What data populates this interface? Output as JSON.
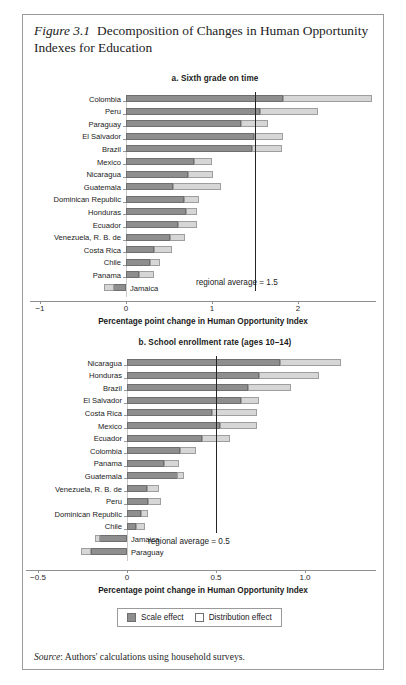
{
  "figure": {
    "number": "Figure 3.1",
    "title": "Decomposition of Changes in Human Opportunity Indexes for Education"
  },
  "source": {
    "label": "Source",
    "text": ": Authors' calculations using household surveys."
  },
  "legend": {
    "scale_label": "Scale effect",
    "distribution_label": "Distribution effect"
  },
  "colors": {
    "scale_effect": "#8e8e8e",
    "distribution_effect": "#d6d6d6",
    "average_line": "#242424",
    "frame": "#9a9a9a"
  },
  "chart_data": [
    {
      "type": "bar",
      "orientation": "horizontal",
      "stacked": true,
      "panel": "a",
      "title": "a. Sixth grade on time",
      "xlabel": "Percentage point change in Human Opportunity Index",
      "ylabel": "",
      "xlim": [
        -1,
        2.9
      ],
      "xticks": [
        -1,
        0,
        1,
        2
      ],
      "xticklabels": [
        "−1",
        "0",
        "1",
        "2"
      ],
      "grid": false,
      "legend_position": "bottom",
      "annotation": "regional average = 1.5",
      "annotation_value": 1.5,
      "categories": [
        "Colombia",
        "Peru",
        "Paraguay",
        "El Salvador",
        "Brazil",
        "Mexico",
        "Nicaragua",
        "Guatemala",
        "Dominican Republic",
        "Honduras",
        "Ecuador",
        "Venezuela, R. B. de",
        "Costa Rica",
        "Chile",
        "Panama",
        "Jamaica"
      ],
      "series": [
        {
          "name": "Scale effect",
          "values": [
            1.83,
            1.56,
            1.34,
            1.49,
            1.47,
            0.79,
            0.72,
            0.55,
            0.68,
            0.7,
            0.61,
            0.51,
            0.33,
            0.28,
            0.15,
            -0.26
          ]
        },
        {
          "name": "Distribution effect",
          "values": [
            1.03,
            0.67,
            0.31,
            0.33,
            0.34,
            0.21,
            0.29,
            0.55,
            0.17,
            0.12,
            0.21,
            0.18,
            0.21,
            0.11,
            0.18,
            0.12
          ]
        }
      ],
      "totals": [
        2.86,
        2.23,
        1.65,
        1.82,
        1.81,
        1.0,
        1.01,
        1.1,
        0.85,
        0.82,
        0.82,
        0.69,
        0.54,
        0.39,
        0.33,
        -0.14
      ]
    },
    {
      "type": "bar",
      "orientation": "horizontal",
      "stacked": true,
      "panel": "b",
      "title": "b. School enrollment rate (ages 10–14)",
      "xlabel": "Percentage point change in Human Opportunity Index",
      "ylabel": "",
      "xlim": [
        -0.5,
        1.28
      ],
      "xticks": [
        -0.5,
        0,
        0.5,
        1.0
      ],
      "xticklabels": [
        "−0.5",
        "0",
        "0.5",
        "1.0"
      ],
      "grid": false,
      "legend_position": "bottom",
      "annotation": "regional average = 0.5",
      "annotation_value": 0.5,
      "categories": [
        "Nicaragua",
        "Honduras",
        "Brazil",
        "El Salvador",
        "Costa Rica",
        "Mexico",
        "Ecuador",
        "Colombia",
        "Panama",
        "Guatemala",
        "Venezuela, R. B. de",
        "Peru",
        "Dominican Republic",
        "Chile",
        "Jamaica",
        "Paraguay"
      ],
      "series": [
        {
          "name": "Scale effect",
          "values": [
            0.86,
            0.74,
            0.68,
            0.64,
            0.48,
            0.52,
            0.42,
            0.3,
            0.21,
            0.32,
            0.11,
            0.12,
            0.08,
            0.05,
            -0.18,
            -0.2
          ]
        },
        {
          "name": "Distribution effect",
          "values": [
            0.34,
            0.34,
            0.24,
            0.1,
            0.25,
            0.21,
            0.16,
            0.09,
            0.08,
            -0.04,
            0.07,
            0.07,
            0.04,
            0.05,
            0.03,
            -0.06
          ]
        }
      ],
      "totals": [
        1.2,
        1.08,
        0.92,
        0.74,
        0.73,
        0.73,
        0.58,
        0.39,
        0.29,
        0.28,
        0.18,
        0.19,
        0.12,
        0.1,
        -0.15,
        -0.26
      ]
    }
  ]
}
